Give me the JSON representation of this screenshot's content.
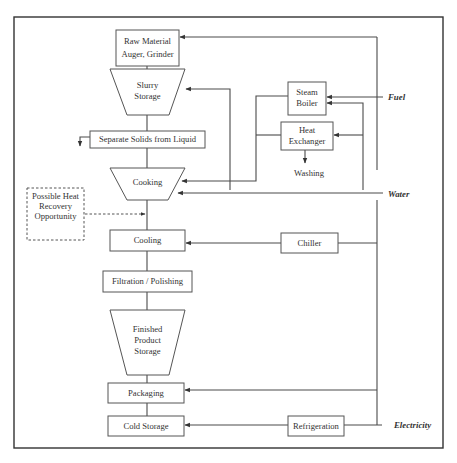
{
  "diagram": {
    "nodes": {
      "raw_material": {
        "line1": "Raw Material",
        "line2": "Auger, Grinder"
      },
      "slurry_storage": {
        "line1": "Slurry",
        "line2": "Storage"
      },
      "separate_solids": {
        "label": "Separate Solids from Liquid"
      },
      "cooking": {
        "label": "Cooking"
      },
      "heat_recovery": {
        "line1": "Possible Heat",
        "line2": "Recovery",
        "line3": "Opportunity"
      },
      "cooling": {
        "label": "Cooling"
      },
      "filtration": {
        "label": "Filtration / Polishing"
      },
      "finished_storage": {
        "line1": "Finished",
        "line2": "Product",
        "line3": "Storage"
      },
      "packaging": {
        "label": "Packaging"
      },
      "cold_storage": {
        "label": "Cold Storage"
      },
      "steam_boiler": {
        "line1": "Steam",
        "line2": "Boiler"
      },
      "heat_exchanger": {
        "line1": "Heat",
        "line2": "Exchanger"
      },
      "washing": {
        "label": "Washing"
      },
      "chiller": {
        "label": "Chiller"
      },
      "refrigeration": {
        "label": "Refrigeration"
      }
    },
    "inputs": {
      "fuel": "Fuel",
      "water": "Water",
      "electricity": "Electricity"
    },
    "colors": {
      "line": "#4a4a4a",
      "box_border": "#555555",
      "text": "#333333",
      "background": "#ffffff"
    }
  }
}
